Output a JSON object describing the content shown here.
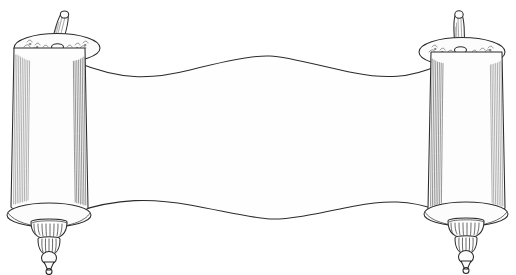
{
  "image": {
    "title": "Open Torah scroll line drawing",
    "subject": "torah-scroll",
    "style": "black and white pen line art",
    "background_color": "#ffffff",
    "ink_color": "#2b2b2b",
    "shading_color": "#6f6f6f",
    "width": 516,
    "height": 275
  },
  "parchment": {
    "name": "blank parchment sheet",
    "fill_color": "#fefefe",
    "text": "",
    "top_edge": "wavy",
    "bottom_edge": "wavy"
  },
  "rollers": [
    {
      "side": "left",
      "name": "left roller",
      "label": "etz chaim",
      "handle_peg": "tapered peg with rounded top",
      "top_cap": "decorated elliptical cap",
      "bottom_finial": "scalloped crown, ribbed bulb, ball and pointed tip",
      "shading": "vertical hatching on both cylinder edges"
    },
    {
      "side": "right",
      "name": "right roller",
      "label": "etz chaim",
      "handle_peg": "tapered peg with rounded top",
      "top_cap": "decorated elliptical cap",
      "bottom_finial": "scalloped crown, ribbed bulb, ball and pointed tip",
      "shading": "vertical hatching on both cylinder edges"
    }
  ]
}
